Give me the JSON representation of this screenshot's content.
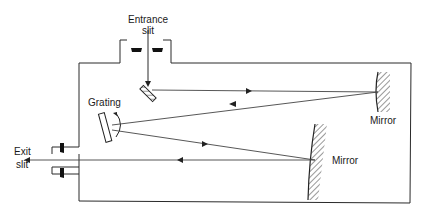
{
  "diagram": {
    "type": "monochromator-schematic",
    "labels": {
      "entrance_slit_line1": "Entrance",
      "entrance_slit_line2": "slit",
      "grating": "Grating",
      "mirror_top": "Mirror",
      "mirror_bottom": "Mirror",
      "exit_slit_line1": "Exit",
      "exit_slit_line2": "slit"
    },
    "colors": {
      "line": "#2a2a2a",
      "background": "#ffffff"
    }
  }
}
